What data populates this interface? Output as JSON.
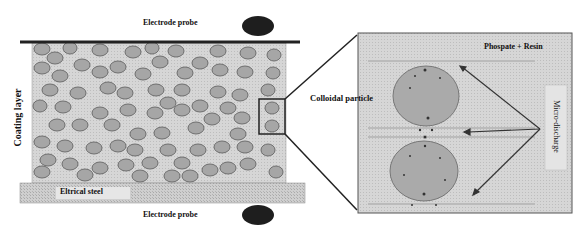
{
  "labels": {
    "electrode_top": "Electrode probe",
    "electrode_bottom": "Electrode probe",
    "coating_layer": "Coating layer",
    "electrical_steel": "Eltrical steel",
    "colloidal_particle": "Colloidal particle",
    "phosphate_resin": "Phospate + Resin",
    "micro_discharge": "Micro-discharge"
  },
  "colors": {
    "coating_fill": "#d9d9d9",
    "particle_fill": "#a8a8a8",
    "particle_stroke": "#707070",
    "steel_fill": "#c8c8c8",
    "electrode": "#222222",
    "inset_fill": "#e0e0e0"
  }
}
